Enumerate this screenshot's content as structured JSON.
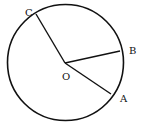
{
  "diagram": {
    "type": "circle-geometry",
    "circle": {
      "cx": 65.5,
      "cy": 62.5,
      "r": 58,
      "stroke": "#111111"
    },
    "center": {
      "label": "O",
      "x": 65,
      "y": 63
    },
    "points": [
      {
        "label": "A",
        "x": 111,
        "y": 94
      },
      {
        "label": "B",
        "x": 120,
        "y": 51
      },
      {
        "label": "C",
        "x": 36,
        "y": 14
      }
    ],
    "segments": [
      "OA",
      "OB",
      "OC"
    ]
  },
  "labels": {
    "O": "O",
    "A": "A",
    "B": "B",
    "C": "C"
  }
}
